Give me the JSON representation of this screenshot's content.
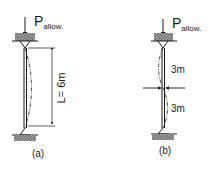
{
  "diagram": {
    "colors": {
      "line": "#1a1a1a",
      "support_fill": "#8c8c8c",
      "background": "#ffffff"
    },
    "panel_a": {
      "load_label_main": "P",
      "load_label_sub": "allow.",
      "length_label": "L= 6m",
      "caption": "(a)"
    },
    "panel_b": {
      "load_label_main": "P",
      "load_label_sub": "allow.",
      "upper_segment_label": "3m",
      "lower_segment_label": "3m",
      "caption": "(b)"
    }
  }
}
